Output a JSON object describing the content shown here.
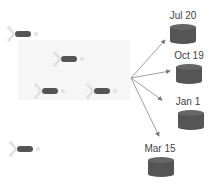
{
  "diagram": {
    "molecules": [
      {
        "x": 6,
        "y": 25
      },
      {
        "x": 52,
        "y": 50
      },
      {
        "x": 33,
        "y": 82
      },
      {
        "x": 85,
        "y": 82
      },
      {
        "x": 8,
        "y": 140
      }
    ],
    "origin": {
      "x": 131,
      "y": 78
    },
    "databases": [
      {
        "label": "Jul 20",
        "x": 168,
        "y": 22
      },
      {
        "label": "Oct 19",
        "x": 174,
        "y": 62
      },
      {
        "label": "Jan 1",
        "x": 178,
        "y": 108
      },
      {
        "label": "Mar 15",
        "x": 148,
        "y": 155
      }
    ],
    "colors": {
      "molecule_body": "#555555",
      "molecule_arms": "#d8d8d8",
      "database": "#555555",
      "arrow": "#777777",
      "label": "#444444",
      "panel": "#f6f6f6"
    }
  }
}
